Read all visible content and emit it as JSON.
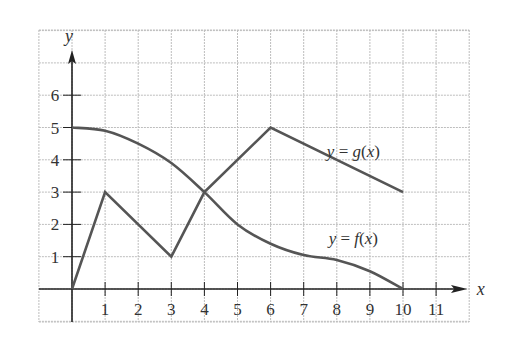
{
  "chart_data": {
    "type": "line",
    "title": "",
    "xlabel": "x",
    "ylabel": "y",
    "xlim": [
      -1,
      12
    ],
    "ylim": [
      -1.7,
      7
    ],
    "grid": true,
    "legend": "inline labels",
    "x_ticks": [
      1,
      2,
      3,
      4,
      5,
      6,
      7,
      8,
      9,
      10,
      11
    ],
    "y_ticks": [
      1,
      2,
      3,
      4,
      5,
      6
    ],
    "series": [
      {
        "name": "y = f(x)",
        "shape": "smooth",
        "x": [
          0,
          1,
          2,
          3,
          4,
          5,
          6,
          7,
          8,
          9,
          10
        ],
        "values": [
          5,
          4.9,
          4.5,
          3.9,
          3,
          2,
          1.4,
          1.05,
          0.9,
          0.55,
          0
        ],
        "label_position": [
          8.5,
          1.4
        ]
      },
      {
        "name": "y = g(x)",
        "shape": "piecewise-linear",
        "x": [
          0,
          1,
          3,
          4,
          6,
          10
        ],
        "values": [
          0,
          3,
          1,
          3,
          5,
          3
        ],
        "label_position": [
          8.5,
          4.1
        ]
      }
    ],
    "colors": {
      "curve": "#555555",
      "axis": "#222222",
      "grid": "#bdbdbd"
    }
  }
}
